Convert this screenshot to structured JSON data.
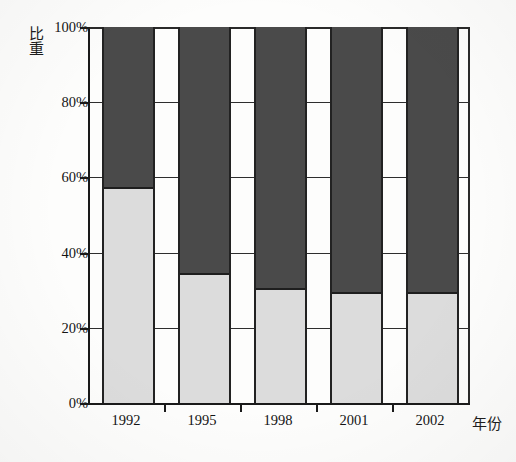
{
  "chart_data": {
    "type": "bar",
    "subtype": "stacked-percentage",
    "title": "",
    "xlabel": "年份",
    "ylabel": "比重",
    "categories": [
      "1992",
      "1995",
      "1998",
      "2001",
      "2002"
    ],
    "ytick_labels": [
      "0%",
      "20%",
      "40%",
      "60%",
      "80%",
      "100%"
    ],
    "ytick_values": [
      0,
      20,
      40,
      60,
      80,
      100
    ],
    "ylim": [
      0,
      100
    ],
    "grid": true,
    "legend": "none",
    "series": [
      {
        "name": "lower-segment",
        "color": "#dcdcdc",
        "values": [
          57,
          34,
          30,
          29,
          29
        ]
      },
      {
        "name": "upper-segment",
        "color": "#4a4a4a",
        "values": [
          43,
          66,
          70,
          71,
          71
        ]
      }
    ]
  },
  "axes": {
    "y_title": "比重",
    "x_title": "年份"
  },
  "colors": {
    "dark_segment": "#4a4a4a",
    "light_segment": "#dcdcdc",
    "axis": "#1a1a1a",
    "grid": "#2e2e2e",
    "background": "#fdfdfc"
  }
}
